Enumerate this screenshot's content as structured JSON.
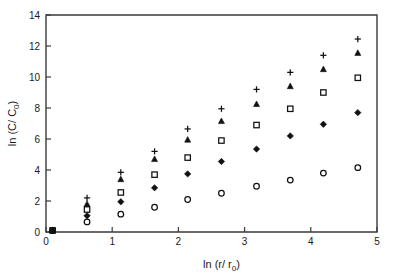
{
  "chart_data": {
    "type": "scatter",
    "title": "",
    "xlabel": "ln (r/ r0)",
    "ylabel": "ln (C/ C0)",
    "xlim": [
      0,
      5
    ],
    "ylim": [
      0,
      14
    ],
    "xticks": [
      0,
      1,
      2,
      3,
      4,
      5
    ],
    "yticks": [
      0,
      2,
      4,
      6,
      8,
      10,
      12,
      14
    ],
    "xtick_labels": [
      "0",
      "1",
      "2",
      "3",
      "4",
      "5"
    ],
    "ytick_labels": [
      "0",
      "2",
      "4",
      "6",
      "8",
      "10",
      "12",
      "14"
    ],
    "grid": false,
    "legend": "none",
    "x": [
      0.1,
      0.62,
      1.13,
      1.64,
      2.14,
      2.65,
      3.18,
      3.69,
      4.19,
      4.71
    ],
    "series": [
      {
        "name": "series-plus",
        "marker": "plus",
        "values": [
          0.1,
          2.2,
          3.85,
          5.2,
          6.65,
          7.95,
          9.2,
          10.3,
          11.4,
          12.45
        ]
      },
      {
        "name": "series-triangle",
        "marker": "filled-triangle",
        "values": [
          0.1,
          1.8,
          3.4,
          4.7,
          5.95,
          7.15,
          8.25,
          9.4,
          10.5,
          11.55
        ]
      },
      {
        "name": "series-square",
        "marker": "open-square",
        "values": [
          0.1,
          1.45,
          2.55,
          3.7,
          4.8,
          5.9,
          6.9,
          7.95,
          9.0,
          9.95
        ]
      },
      {
        "name": "series-diamond",
        "marker": "filled-diamond",
        "values": [
          0.1,
          1.05,
          1.95,
          2.85,
          3.75,
          4.55,
          5.35,
          6.2,
          6.95,
          7.7
        ]
      },
      {
        "name": "series-circle",
        "marker": "open-circle",
        "values": [
          0.1,
          0.65,
          1.15,
          1.6,
          2.1,
          2.5,
          2.95,
          3.35,
          3.8,
          4.15
        ]
      }
    ]
  },
  "geometry": {
    "plot_left": 46,
    "plot_right": 377,
    "plot_top": 15,
    "plot_bottom": 232
  }
}
